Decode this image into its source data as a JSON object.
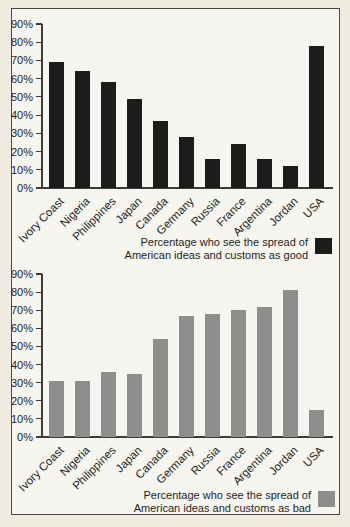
{
  "figure": {
    "background": "#efecdf",
    "panel_background": "#f6f5ef",
    "border_color": "#4a4a4a",
    "text_color": "#1e1e1e"
  },
  "chart_data": [
    {
      "id": "good",
      "type": "bar",
      "title": "",
      "xlabel": "",
      "ylabel": "",
      "categories": [
        "Ivory Coast",
        "Nigeria",
        "Philippines",
        "Japan",
        "Canada",
        "Germany",
        "Russia",
        "France",
        "Argentina",
        "Jordan",
        "USA"
      ],
      "values": [
        69,
        64,
        58,
        49,
        37,
        28,
        16,
        24,
        16,
        12,
        78
      ],
      "bar_color": "#1c1c1c",
      "ylim": [
        0,
        90
      ],
      "ytick_step": 10,
      "ytick_suffix": "%",
      "grid": false,
      "legend_position": "bottom-right",
      "legend_line1": "Percentage who see the spread of",
      "legend_line2": "American ideas and customs as good"
    },
    {
      "id": "bad",
      "type": "bar",
      "title": "",
      "xlabel": "",
      "ylabel": "",
      "categories": [
        "Ivory Coast",
        "Nigeria",
        "Philippines",
        "Japan",
        "Canada",
        "Germany",
        "Russia",
        "France",
        "Argentina",
        "Jordan",
        "USA"
      ],
      "values": [
        31,
        31,
        36,
        35,
        54,
        67,
        68,
        70,
        72,
        81,
        15
      ],
      "bar_color": "#8e8e8e",
      "ylim": [
        0,
        90
      ],
      "ytick_step": 10,
      "ytick_suffix": "%",
      "grid": false,
      "legend_position": "bottom-right",
      "legend_line1": "Percentage who see the spread of",
      "legend_line2": "American ideas and customs as bad"
    }
  ]
}
